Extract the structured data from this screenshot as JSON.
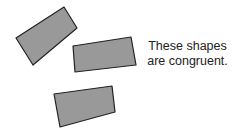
{
  "diagram": {
    "caption": {
      "line1": "These shapes",
      "line2": "are congruent."
    },
    "colors": {
      "fill": "#999999",
      "stroke": "#222222",
      "background": "#ffffff"
    },
    "shapes": [
      {
        "name": "quadrilateral-1",
        "points": "16,38 64,7 77,28 33,65"
      },
      {
        "name": "quadrilateral-2",
        "points": "73,46 131,37 136,65 75,72"
      },
      {
        "name": "quadrilateral-3",
        "points": "54,94 112,86 115,112 60,127"
      }
    ]
  }
}
